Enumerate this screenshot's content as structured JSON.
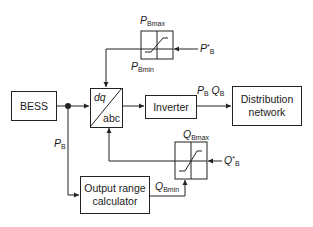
{
  "diagram": {
    "type": "block-diagram",
    "blocks": {
      "bess": "BESS",
      "transform_top": "dq",
      "transform_bottom": "abc",
      "inverter": "Inverter",
      "distribution_line1": "Distribution",
      "distribution_line2": "network",
      "calculator_line1": "Output range",
      "calculator_line2": "calculator"
    },
    "labels": {
      "p_bmax": {
        "main": "P",
        "sub": "Bmax"
      },
      "p_bmin": {
        "main": "P",
        "sub": "Bmin"
      },
      "p_ref": {
        "main": "P",
        "sup": "*",
        "sub": "B"
      },
      "q_bmax": {
        "main": "Q",
        "sub": "Bmax"
      },
      "q_bmin": {
        "main": "Q",
        "sub": "Bmin"
      },
      "q_ref": {
        "main": "Q",
        "sup": "*",
        "sub": "B"
      },
      "p_b": {
        "main": "P",
        "sub": "B"
      },
      "output_p": {
        "main": "P",
        "sub": "B"
      },
      "output_q": {
        "main": "Q",
        "sub": "B"
      }
    },
    "colors": {
      "line": "#222222",
      "background": "#ffffff"
    }
  }
}
